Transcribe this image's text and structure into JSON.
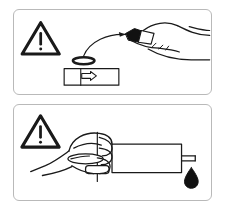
{
  "document": {
    "title": "Toner Cartridge Handling Caution Illustration",
    "type": "instruction-panels",
    "background_color": "#ffffff",
    "line_color": "#1a1a1a",
    "panel_border_color": "#b9b9b9",
    "fill_black": "#000000"
  },
  "panels": [
    {
      "id": "panel-top",
      "name": "remove-seal-panel",
      "caption": "",
      "elements": [
        {
          "name": "warning-triangle-icon",
          "symbol": "exclamation-in-triangle",
          "label": "!"
        },
        {
          "name": "sealing-ring-part",
          "symbol": "oval-gasket-ring"
        },
        {
          "name": "cartridge-slot-part",
          "symbol": "rectangular-cartridge-with-arrow"
        },
        {
          "name": "curved-arrow-icon",
          "symbol": "curved-motion-arrow"
        },
        {
          "name": "hand-holding-applicator",
          "symbol": "hand-with-black-tipped-tool"
        }
      ]
    },
    {
      "id": "panel-bottom",
      "name": "handle-roller-panel",
      "caption": "",
      "elements": [
        {
          "name": "warning-triangle-icon",
          "symbol": "exclamation-in-triangle",
          "label": "!"
        },
        {
          "name": "hand-gripping-roller",
          "symbol": "hand-grasping-shaft"
        },
        {
          "name": "roller-drum-part",
          "symbol": "cylinder-with-axle"
        },
        {
          "name": "ink-droplet-icon",
          "symbol": "filled-teardrop"
        }
      ]
    }
  ]
}
